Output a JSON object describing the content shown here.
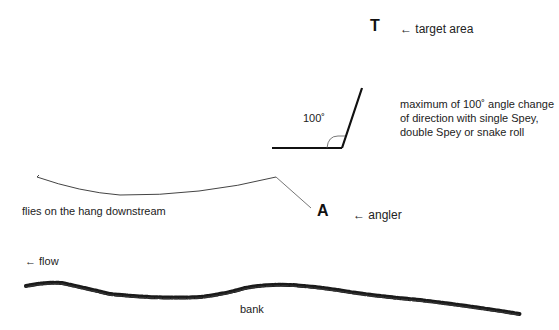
{
  "labels": {
    "target_marker": "T",
    "target_label": "← target area",
    "angle_value": "100˚",
    "angle_note": "maximum of 100˚ angle change of direction with single Spey, double Spey or snake roll",
    "flies_label": "flies on the hang downstream",
    "angler_marker": "A",
    "angler_label": "← angler",
    "flow_label": "← flow",
    "bank_label": "bank"
  },
  "colors": {
    "line": "#111111",
    "fly_line": "#444444",
    "bank": "#1a1a1a",
    "background": "#ffffff"
  }
}
